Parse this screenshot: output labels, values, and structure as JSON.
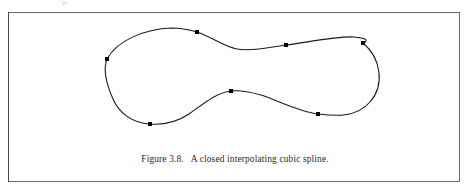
{
  "figure": {
    "caption_label": "Figure 3.8.",
    "caption_text": "A closed interpolating cubic spline.",
    "frame_border_color": "#6c6c6c",
    "background_color": "#ffffff"
  },
  "chart_data": {
    "type": "scatter",
    "title": "A closed interpolating cubic spline",
    "xlabel": "",
    "ylabel": "",
    "grid": false,
    "legend": null,
    "axis_visible": false,
    "curve_style": "closed periodic cubic spline through all knots",
    "curve_color": "#1a1a1a",
    "curve_width": 1.1,
    "knot_marker": "filled square",
    "knot_color": "#000000",
    "knot_size": 4,
    "xlim": [
      0,
      452
    ],
    "ylim": [
      0,
      128
    ],
    "knot_labels": [
      "left",
      "top",
      "upper-right",
      "far-right",
      "lower-right",
      "middle-hump",
      "bottom-left"
    ],
    "x": [
      98,
      188,
      277,
      354,
      309,
      222,
      141
    ],
    "y": [
      46,
      19,
      32,
      30,
      101,
      78,
      111
    ],
    "points": [
      {
        "x": 98,
        "y": 46
      },
      {
        "x": 188,
        "y": 19
      },
      {
        "x": 277,
        "y": 32
      },
      {
        "x": 354,
        "y": 30
      },
      {
        "x": 309,
        "y": 101
      },
      {
        "x": 222,
        "y": 78
      },
      {
        "x": 141,
        "y": 111
      }
    ],
    "path": "M 98,46 C 108,28 134,16 163,15 C 174,15 181,17 188,19 C 203,24 214,33 228,36 C 243,39 262,34 277,32 C 300,29 329,23 345,24 C 356,25 361,27 354,30 C 372,45 376,72 361,89 C 347,105 326,103 309,101 C 288,98 268,87 252,82 C 241,79 231,77 222,78 C 206,80 193,92 180,101 C 168,109 155,112 141,111 C 123,110 110,100 104,86 C 96,68 94,56 98,46 Z"
  }
}
